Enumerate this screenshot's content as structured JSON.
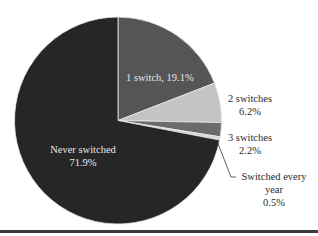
{
  "chart_data": {
    "type": "pie",
    "title": "",
    "start_angle": "top (12 o'clock), clockwise",
    "slices": [
      {
        "label": "1 switch",
        "value": 19.1,
        "display": "1 switch, 19.1%",
        "color": "#555555"
      },
      {
        "label": "2 switches",
        "value": 6.2,
        "display": "2 switches\n6.2%",
        "color": "#c4c4c4"
      },
      {
        "label": "3 switches",
        "value": 2.2,
        "display": "3 switches\n2.2%",
        "color": "#6b6b6b"
      },
      {
        "label": "Switched every year",
        "value": 0.5,
        "display": "Switched every\nyear\n0.5%",
        "color": "#d8d8d8"
      },
      {
        "label": "Never switched",
        "value": 71.9,
        "display": "Never switched\n71.9%",
        "color": "#262626"
      }
    ],
    "legend": "none (direct labels)"
  },
  "labels": {
    "one_switch": "1 switch, 19.1%",
    "two_switches_name": "2 switches",
    "two_switches_pct": "6.2%",
    "three_switches_name": "3 switches",
    "three_switches_pct": "2.2%",
    "every_year_name_1": "Switched every",
    "every_year_name_2": "year",
    "every_year_pct": "0.5%",
    "never_name": "Never switched",
    "never_pct": "71.9%"
  }
}
